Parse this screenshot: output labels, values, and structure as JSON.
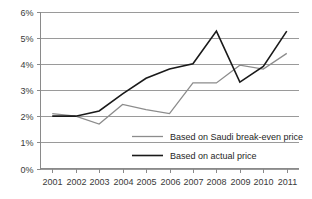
{
  "chart_data": {
    "type": "line",
    "title": "",
    "subtitle": "",
    "xlabel": "",
    "ylabel": "",
    "categories": [
      "2001",
      "2002",
      "2003",
      "2004",
      "2005",
      "2006",
      "2007",
      "2008",
      "2009",
      "2010",
      "2011"
    ],
    "x": [
      2001,
      2002,
      2003,
      2004,
      2005,
      2006,
      2007,
      2008,
      2009,
      2010,
      2011
    ],
    "series": [
      {
        "name": "Based on Saudi break-even price",
        "color": "#8c8c8c",
        "values": [
          2.1,
          2.0,
          1.7,
          2.45,
          2.25,
          2.1,
          3.27,
          3.27,
          3.95,
          3.8,
          4.4
        ]
      },
      {
        "name": "Based on actual price",
        "color": "#1a1a1a",
        "values": [
          2.0,
          2.0,
          2.2,
          2.85,
          3.45,
          3.8,
          4.0,
          5.25,
          3.3,
          3.9,
          5.25
        ]
      }
    ],
    "ylim": [
      0,
      6
    ],
    "yticks": [
      0,
      1,
      2,
      3,
      4,
      5,
      6
    ],
    "ytick_labels": [
      "0%",
      "1%",
      "2%",
      "3%",
      "4%",
      "5%",
      "6%"
    ],
    "xtick_labels": [
      "2001",
      "2002",
      "2003",
      "2004",
      "2005",
      "2006",
      "2007",
      "2008",
      "2009",
      "2010",
      "2011"
    ],
    "grid": true,
    "grid_axis": "y",
    "legend_position": "inside-lower-right",
    "value_unit": "%"
  },
  "legend": {
    "items": [
      {
        "label": "Based on Saudi break-even price",
        "color": "#8c8c8c"
      },
      {
        "label": "Based on actual price",
        "color": "#1a1a1a"
      }
    ]
  },
  "axes": {
    "y_tick_labels": [
      "6%",
      "5%",
      "4%",
      "3%",
      "2%",
      "1%",
      "0%"
    ],
    "x_tick_labels": [
      "2001",
      "2002",
      "2003",
      "2004",
      "2005",
      "2006",
      "2007",
      "2008",
      "2009",
      "2010",
      "2011"
    ]
  },
  "colors": {
    "grid": "#9a9a9a",
    "axis": "#8a8a8a",
    "text": "#3a3a3a",
    "legend_text": "#262626",
    "background": "#ffffff",
    "series_gray": "#8c8c8c",
    "series_black": "#1a1a1a"
  }
}
